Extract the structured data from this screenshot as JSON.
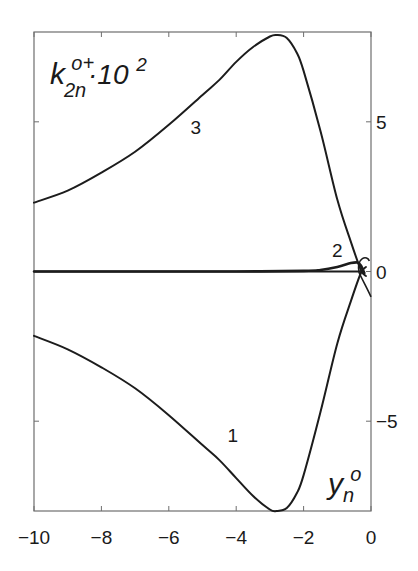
{
  "chart_data": {
    "type": "line",
    "title": "",
    "xlabel": "y_n^o",
    "ylabel": "k_2n^o+ · 10^2",
    "xlim": [
      -10,
      0
    ],
    "ylim": [
      -8,
      8
    ],
    "grid": false,
    "legend": "none (curves labeled inline 1, 2, 3)",
    "x_ticks": [
      -10,
      -8,
      -6,
      -4,
      -2,
      0
    ],
    "x_tick_labels": [
      "−10",
      "−8",
      "−6",
      "−4",
      "−2",
      "0"
    ],
    "y_ticks": [
      -5,
      0,
      5
    ],
    "y_tick_labels": [
      "−5",
      "0",
      "5"
    ],
    "y_axis_side": "right",
    "series": [
      {
        "name": "1",
        "x": [
          -10,
          -9,
          -8,
          -7,
          -6,
          -5,
          -4.5,
          -4,
          -3.5,
          -3,
          -2.8,
          -2.5,
          -2.2,
          -2,
          -1.5,
          -1,
          -0.6,
          -0.3,
          -0.15
        ],
        "y": [
          -2.15,
          -2.6,
          -3.2,
          -3.9,
          -4.8,
          -5.8,
          -6.3,
          -6.9,
          -7.5,
          -7.95,
          -8.0,
          -7.9,
          -7.4,
          -6.8,
          -4.7,
          -2.4,
          -1.0,
          -0.05,
          0.15
        ]
      },
      {
        "name": "2",
        "x": [
          -10,
          -8,
          -6,
          -4,
          -2,
          -1.5,
          -1,
          -0.6,
          -0.4,
          -0.3,
          -0.2
        ],
        "y": [
          0.0,
          0.0,
          0.0,
          0.0,
          0.02,
          0.05,
          0.15,
          0.28,
          0.3,
          0.2,
          -0.05
        ]
      },
      {
        "name": "3",
        "x": [
          -10,
          -9,
          -8,
          -7,
          -6,
          -5,
          -4.5,
          -4,
          -3.5,
          -3,
          -2.8,
          -2.5,
          -2.2,
          -2,
          -1.5,
          -1,
          -0.6,
          -0.3,
          -0.15
        ],
        "y": [
          2.3,
          2.7,
          3.3,
          4.0,
          4.9,
          5.9,
          6.4,
          7.0,
          7.5,
          7.85,
          7.9,
          7.8,
          7.3,
          6.7,
          4.7,
          2.4,
          1.0,
          0.05,
          -0.15
        ]
      }
    ],
    "annotations": [
      {
        "text": "1",
        "x": -4.1,
        "y": -5.7
      },
      {
        "text": "2",
        "x": -1.0,
        "y": 0.5
      },
      {
        "text": "3",
        "x": -5.2,
        "y": 4.6
      }
    ]
  },
  "labels": {
    "ylabel_main": "k",
    "ylabel_sup": "o+",
    "ylabel_sub": "2n",
    "ylabel_factor": "·10",
    "ylabel_factor_exp": "2",
    "xlabel_main": "y",
    "xlabel_sup": "o",
    "xlabel_sub": "n"
  }
}
